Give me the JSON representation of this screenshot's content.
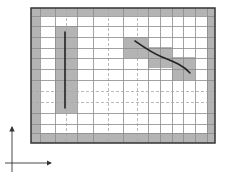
{
  "diagram": {
    "frame": {
      "x": 31,
      "y": 8,
      "width": 184,
      "height": 135,
      "border_color": "#333333",
      "border_width": 1.5
    },
    "border_band": {
      "inner_x": 40,
      "inner_y": 16,
      "inner_width": 167,
      "inner_height": 117,
      "color": "#b4b4b4"
    },
    "grid": {
      "solid_color": "#8a8a8a",
      "dashed_color": "#a8a8a8",
      "vertical_lines": [
        {
          "x": 40,
          "style": "solid"
        },
        {
          "x": 55,
          "style": "solid"
        },
        {
          "x": 66,
          "style": "dashed"
        },
        {
          "x": 77,
          "style": "solid"
        },
        {
          "x": 93,
          "style": "solid"
        },
        {
          "x": 108,
          "style": "dashed"
        },
        {
          "x": 123,
          "style": "solid"
        },
        {
          "x": 137,
          "style": "dashed"
        },
        {
          "x": 148,
          "style": "solid"
        },
        {
          "x": 160,
          "style": "solid"
        },
        {
          "x": 172,
          "style": "solid"
        },
        {
          "x": 183,
          "style": "solid"
        },
        {
          "x": 195,
          "style": "solid"
        },
        {
          "x": 207,
          "style": "solid"
        }
      ],
      "horizontal_lines": [
        {
          "y": 16,
          "style": "solid"
        },
        {
          "y": 26,
          "style": "solid"
        },
        {
          "y": 37,
          "style": "solid"
        },
        {
          "y": 48,
          "style": "solid"
        },
        {
          "y": 58,
          "style": "solid"
        },
        {
          "y": 69,
          "style": "solid"
        },
        {
          "y": 80,
          "style": "solid"
        },
        {
          "y": 91,
          "style": "dashed"
        },
        {
          "y": 102,
          "style": "dashed"
        },
        {
          "y": 113,
          "style": "solid"
        },
        {
          "y": 124,
          "style": "solid"
        },
        {
          "y": 133,
          "style": "solid"
        }
      ]
    },
    "highlight_color": "#b4b4b4",
    "highlighted_cells": [
      {
        "name": "vertical-line-cells",
        "x": 55,
        "y": 26,
        "width": 22,
        "height": 87
      },
      {
        "name": "curve-cells-1",
        "x": 124,
        "y": 37,
        "width": 24,
        "height": 21
      },
      {
        "name": "curve-cells-2",
        "x": 148,
        "y": 47,
        "width": 24,
        "height": 21
      },
      {
        "name": "curve-cells-3",
        "x": 172,
        "y": 57,
        "width": 23,
        "height": 23
      }
    ],
    "features": [
      {
        "name": "vertical-line-feature",
        "type": "line",
        "path": "M65,32 L65,108",
        "color": "#222222",
        "width": 1.6
      },
      {
        "name": "curve-feature",
        "type": "curve",
        "path": "M135,41 C145,48 152,53 162,57 C175,62 184,66 190,73",
        "color": "#222222",
        "width": 1.6
      }
    ],
    "axes": {
      "color": "#333333",
      "origin": {
        "x": 12,
        "y": 163
      },
      "y_axis": {
        "x": 12,
        "y1": 172,
        "y2": 127
      },
      "x_axis": {
        "y": 163,
        "x1": 5,
        "x2": 51
      }
    }
  }
}
